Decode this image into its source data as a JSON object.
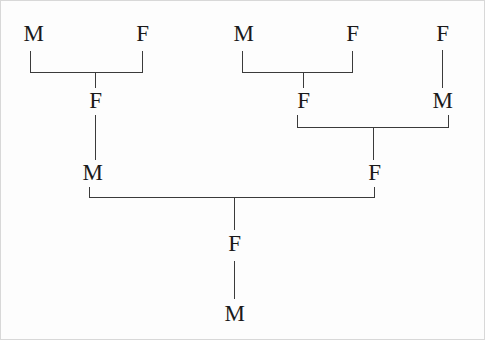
{
  "diagram": {
    "type": "family-tree",
    "background_color": "#fdfdfd",
    "line_color": "#3b3b3b",
    "text_color": "#1a1a1a",
    "generations": 4,
    "nodes": [
      {
        "id": "g1-m1",
        "label": "M",
        "generation": 1,
        "x": 17,
        "y": 22
      },
      {
        "id": "g1-f1",
        "label": "F",
        "generation": 1,
        "x": 126,
        "y": 22
      },
      {
        "id": "g1-m2",
        "label": "M",
        "generation": 1,
        "x": 227,
        "y": 22
      },
      {
        "id": "g1-f2",
        "label": "F",
        "generation": 1,
        "x": 336,
        "y": 22
      },
      {
        "id": "g1-f3",
        "label": "F",
        "generation": 1,
        "x": 426,
        "y": 22
      },
      {
        "id": "g2-f1",
        "label": "F",
        "generation": 2,
        "x": 79,
        "y": 89
      },
      {
        "id": "g2-f2",
        "label": "F",
        "generation": 2,
        "x": 287,
        "y": 89
      },
      {
        "id": "g2-m1",
        "label": "M",
        "generation": 2,
        "x": 426,
        "y": 89
      },
      {
        "id": "g3-m1",
        "label": "M",
        "generation": 3,
        "x": 76,
        "y": 161
      },
      {
        "id": "g3-f1",
        "label": "F",
        "generation": 3,
        "x": 358,
        "y": 161
      },
      {
        "id": "g4-f1",
        "label": "F",
        "generation": 4,
        "x": 218,
        "y": 232
      },
      {
        "id": "g5-m1",
        "label": "M",
        "generation": 5,
        "x": 218,
        "y": 302
      }
    ],
    "connectors": [
      {
        "id": "c1",
        "note": "M+F (left pair) bracket to child F"
      },
      {
        "id": "c2",
        "note": "F down to M (gen 3 left)"
      },
      {
        "id": "c3",
        "note": "M+F (middle pair) bracket to child F"
      },
      {
        "id": "c4",
        "note": "F (top right) down to M"
      },
      {
        "id": "c5",
        "note": "F+M bracket to child F (gen 3 right)"
      },
      {
        "id": "c6",
        "note": "M+F (gen 3) bracket to child F (gen 4)"
      },
      {
        "id": "c7",
        "note": "F down to M (bottom)"
      }
    ]
  }
}
